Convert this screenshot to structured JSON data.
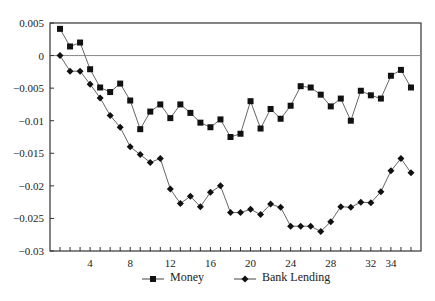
{
  "chart_data": {
    "type": "line",
    "title": "",
    "xlabel": "",
    "ylabel": "",
    "xlim": [
      0,
      37
    ],
    "ylim": [
      -0.03,
      0.005
    ],
    "x_ticks": [
      4,
      8,
      12,
      16,
      20,
      24,
      28,
      32,
      34
    ],
    "x_minor_tick_step": 1,
    "y_ticks": [
      0.005,
      0,
      -0.005,
      -0.01,
      -0.015,
      -0.02,
      -0.025,
      -0.03
    ],
    "y_tick_labels": [
      "0.005",
      "0",
      "−0.005",
      "−0.01",
      "−0.015",
      "−0.02",
      "−0.025",
      "−0.03"
    ],
    "x_tick_labels": [
      "4",
      "8",
      "12",
      "16",
      "20",
      "24",
      "28",
      "32",
      "34"
    ],
    "grid": false,
    "zero_line": true,
    "legend_position": "bottom",
    "x": [
      1,
      2,
      3,
      4,
      5,
      6,
      7,
      8,
      9,
      10,
      11,
      12,
      13,
      14,
      15,
      16,
      17,
      18,
      19,
      20,
      21,
      22,
      23,
      24,
      25,
      26,
      27,
      28,
      29,
      30,
      31,
      32,
      33,
      34,
      35,
      36
    ],
    "series": [
      {
        "name": "Money",
        "marker": "square",
        "values": [
          0.0041,
          0.0014,
          0.002,
          -0.0021,
          -0.0049,
          -0.0056,
          -0.0043,
          -0.0069,
          -0.0113,
          -0.0086,
          -0.0075,
          -0.0096,
          -0.0075,
          -0.0088,
          -0.0103,
          -0.011,
          -0.0098,
          -0.0125,
          -0.012,
          -0.007,
          -0.0112,
          -0.0082,
          -0.0097,
          -0.0077,
          -0.0047,
          -0.0049,
          -0.006,
          -0.0078,
          -0.0066,
          -0.01,
          -0.0054,
          -0.0061,
          -0.0066,
          -0.0031,
          -0.0022,
          -0.0049
        ]
      },
      {
        "name": "Bank Lending",
        "marker": "diamond",
        "values": [
          0,
          -0.0024,
          -0.0024,
          -0.0044,
          -0.0065,
          -0.0092,
          -0.011,
          -0.014,
          -0.0152,
          -0.0164,
          -0.0158,
          -0.0205,
          -0.0227,
          -0.0216,
          -0.0232,
          -0.021,
          -0.02,
          -0.0241,
          -0.0241,
          -0.0236,
          -0.0244,
          -0.0228,
          -0.0233,
          -0.0262,
          -0.0262,
          -0.0262,
          -0.027,
          -0.0255,
          -0.0232,
          -0.0233,
          -0.0225,
          -0.0226,
          -0.0209,
          -0.0177,
          -0.0158,
          -0.018
        ]
      }
    ]
  },
  "legend": {
    "money_label": "Money",
    "bank_label": "Bank Lending"
  }
}
